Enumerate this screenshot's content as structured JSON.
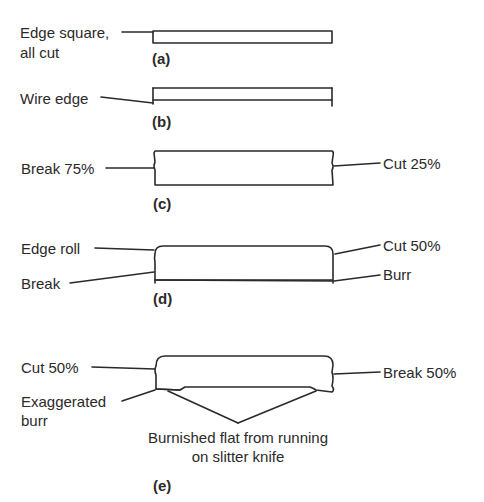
{
  "colors": {
    "ink": "#2a2a2a",
    "background": "#ffffff"
  },
  "figures": {
    "a": {
      "tag": "(a)",
      "left_label_line1": "Edge square,",
      "left_label_line2": "all cut"
    },
    "b": {
      "tag": "(b)",
      "left_label": "Wire edge"
    },
    "c": {
      "tag": "(c)",
      "left_label": "Break 75%",
      "right_label": "Cut 25%"
    },
    "d": {
      "tag": "(d)",
      "left_top_label": "Edge roll",
      "left_bottom_label": "Break",
      "right_top_label": "Cut 50%",
      "right_bottom_label": "Burr"
    },
    "e": {
      "tag": "(e)",
      "left_top_label": "Cut 50%",
      "left_bottom_label_line1": "Exaggerated",
      "left_bottom_label_line2": "burr",
      "right_label": "Break 50%",
      "bottom_label_line1": "Burnished flat from running",
      "bottom_label_line2": "on slitter knife"
    }
  }
}
